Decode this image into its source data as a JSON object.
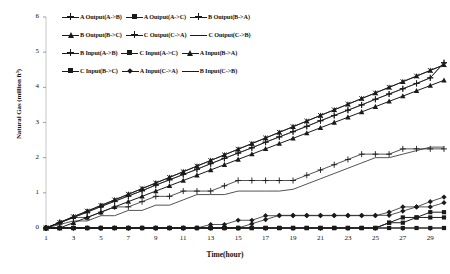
{
  "chart_data": {
    "type": "line",
    "title": "",
    "xlabel": "Time(hour)",
    "ylabel": "Natural Gas (million ft³)",
    "xlim": [
      1,
      30
    ],
    "ylim": [
      0,
      6
    ],
    "ytick_values": [
      0,
      1,
      2,
      3,
      4,
      5,
      6
    ],
    "ytick_labels": [
      "0",
      "1",
      "2",
      "3",
      "4",
      "5",
      "6"
    ],
    "xtick_values": [
      1,
      3,
      5,
      7,
      9,
      11,
      13,
      15,
      17,
      19,
      21,
      23,
      25,
      27,
      29
    ],
    "xtick_labels": [
      "1",
      "3",
      "5",
      "7",
      "9",
      "11",
      "13",
      "15",
      "17",
      "19",
      "21",
      "23",
      "25",
      "27",
      "29"
    ],
    "grid": false,
    "legend_position": "top-left",
    "line_color": "#1a1a1a",
    "x": [
      1,
      2,
      3,
      4,
      5,
      6,
      7,
      8,
      9,
      10,
      11,
      12,
      13,
      14,
      15,
      16,
      17,
      18,
      19,
      20,
      21,
      22,
      23,
      24,
      25,
      26,
      27,
      28,
      29,
      30
    ],
    "series": [
      {
        "name": "A Output(A->B)",
        "marker": "plus",
        "values": [
          0,
          0.15,
          0.3,
          0.45,
          0.61,
          0.76,
          0.91,
          1.06,
          1.22,
          1.37,
          1.52,
          1.67,
          1.83,
          1.98,
          2.13,
          2.28,
          2.44,
          2.59,
          2.74,
          2.89,
          3.05,
          3.2,
          3.35,
          3.5,
          3.66,
          3.81,
          3.96,
          4.11,
          4.27,
          4.7
        ]
      },
      {
        "name": "A Output(A->C)",
        "marker": "square",
        "values": [
          0,
          0,
          0,
          0,
          0,
          0,
          0,
          0,
          0,
          0,
          0,
          0,
          0,
          0,
          0,
          0,
          0,
          0,
          0,
          0,
          0,
          0,
          0,
          0,
          0,
          0,
          0,
          0,
          0,
          0
        ]
      },
      {
        "name": "B Output(B->A)",
        "marker": "cross",
        "values": [
          0,
          0.16,
          0.32,
          0.48,
          0.64,
          0.8,
          0.96,
          1.12,
          1.28,
          1.44,
          1.6,
          1.76,
          1.92,
          2.08,
          2.24,
          2.4,
          2.56,
          2.72,
          2.88,
          3.04,
          3.2,
          3.36,
          3.52,
          3.68,
          3.84,
          4.0,
          4.16,
          4.32,
          4.48,
          4.64
        ]
      },
      {
        "name": "B Output(B->C)",
        "marker": "tri",
        "values": [
          0,
          0,
          0.15,
          0.3,
          0.45,
          0.6,
          0.75,
          0.9,
          1.05,
          1.2,
          1.35,
          1.5,
          1.65,
          1.8,
          1.95,
          2.1,
          2.25,
          2.4,
          2.55,
          2.7,
          2.85,
          3.0,
          3.15,
          3.3,
          3.45,
          3.6,
          3.75,
          3.9,
          4.05,
          4.2
        ]
      },
      {
        "name": "C Output(C->A)",
        "marker": "plus",
        "values": [
          0,
          0.15,
          0.3,
          0.3,
          0.45,
          0.6,
          0.6,
          0.75,
          0.9,
          0.9,
          1.05,
          1.05,
          1.05,
          1.2,
          1.35,
          1.35,
          1.35,
          1.35,
          1.35,
          1.5,
          1.65,
          1.8,
          1.95,
          2.1,
          2.1,
          2.1,
          2.25,
          2.25,
          2.25,
          2.25
        ]
      },
      {
        "name": "C Output(C->B)",
        "marker": "none",
        "values": [
          0,
          0.1,
          0.2,
          0.2,
          0.35,
          0.35,
          0.5,
          0.5,
          0.65,
          0.65,
          0.8,
          0.95,
          0.95,
          0.95,
          1.05,
          1.05,
          1.05,
          1.05,
          1.1,
          1.25,
          1.4,
          1.55,
          1.7,
          1.85,
          2.0,
          2.0,
          2.1,
          2.2,
          2.3,
          2.3
        ]
      },
      {
        "name": "B Input(A->B)",
        "marker": "plus",
        "values": [
          0,
          0.15,
          0.3,
          0.45,
          0.61,
          0.76,
          0.91,
          1.06,
          1.22,
          1.37,
          1.52,
          1.67,
          1.83,
          1.98,
          2.13,
          2.28,
          2.44,
          2.59,
          2.74,
          2.89,
          3.05,
          3.2,
          3.35,
          3.5,
          3.66,
          3.81,
          3.96,
          4.11,
          4.27,
          4.7
        ]
      },
      {
        "name": "C Input(A->C)",
        "marker": "square",
        "values": [
          0,
          0,
          0,
          0,
          0,
          0,
          0,
          0,
          0,
          0,
          0,
          0,
          0,
          0,
          0,
          0,
          0,
          0,
          0,
          0,
          0,
          0,
          0,
          0,
          0,
          0.15,
          0.3,
          0.3,
          0.45,
          0.45
        ]
      },
      {
        "name": "A Input(B->A)",
        "marker": "tri",
        "values": [
          0,
          0.16,
          0.32,
          0.48,
          0.64,
          0.8,
          0.96,
          1.12,
          1.28,
          1.44,
          1.6,
          1.76,
          1.92,
          2.08,
          2.24,
          2.4,
          2.56,
          2.72,
          2.88,
          3.04,
          3.2,
          3.36,
          3.52,
          3.68,
          3.84,
          4.0,
          4.16,
          4.32,
          4.48,
          4.64
        ]
      },
      {
        "name": "C Input(B->C)",
        "marker": "square",
        "values": [
          0,
          0,
          0,
          0,
          0,
          0,
          0,
          0,
          0,
          0,
          0,
          0,
          0,
          0,
          0,
          0,
          0,
          0,
          0,
          0,
          0,
          0,
          0,
          0,
          0,
          0.15,
          0.15,
          0.3,
          0.3,
          0.3
        ]
      },
      {
        "name": "A Input(C->A)",
        "marker": "diamond",
        "values": [
          0,
          0,
          0,
          0,
          0,
          0,
          0,
          0,
          0,
          0,
          0,
          0,
          0.1,
          0.1,
          0.22,
          0.22,
          0.35,
          0.35,
          0.35,
          0.35,
          0.35,
          0.35,
          0.35,
          0.35,
          0.35,
          0.45,
          0.6,
          0.6,
          0.75,
          0.88
        ]
      },
      {
        "name": "B Input(C->B)",
        "marker": "diamond",
        "values": [
          0,
          0,
          0,
          0,
          0,
          0,
          0,
          0,
          0,
          0,
          0,
          0,
          0,
          0,
          0,
          0.12,
          0.24,
          0.36,
          0.36,
          0.36,
          0.36,
          0.36,
          0.36,
          0.36,
          0.36,
          0.36,
          0.48,
          0.6,
          0.6,
          0.72
        ]
      }
    ]
  },
  "legend": {
    "rows": [
      [
        {
          "label": "A Output(A->B)",
          "marker": "plus"
        },
        {
          "label": "A Output(A->C)",
          "marker": "square"
        },
        {
          "label": "B Output(B->A)",
          "marker": "cross"
        }
      ],
      [
        {
          "label": "B Output(B->C)",
          "marker": "tri"
        },
        {
          "label": "C Output(C->A)",
          "marker": "plus"
        },
        {
          "label": "C Output(C->B)",
          "marker": "none"
        }
      ],
      [
        {
          "label": "B Input(A->B)",
          "marker": "plus"
        },
        {
          "label": "C Input(A->C)",
          "marker": "square"
        },
        {
          "label": "A Input(B->A)",
          "marker": "tri"
        }
      ],
      [
        {
          "label": "C Input(B->C)",
          "marker": "square"
        },
        {
          "label": "A Input(C->A)",
          "marker": "diamond"
        },
        {
          "label": "B Input(C->B)",
          "marker": "none"
        }
      ]
    ]
  }
}
